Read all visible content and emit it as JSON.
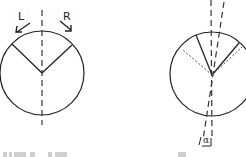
{
  "diagram": {
    "left_panel": {
      "label_left": "L",
      "label_right": "R"
    },
    "right_panel": {
      "angle_label": "α"
    }
  }
}
